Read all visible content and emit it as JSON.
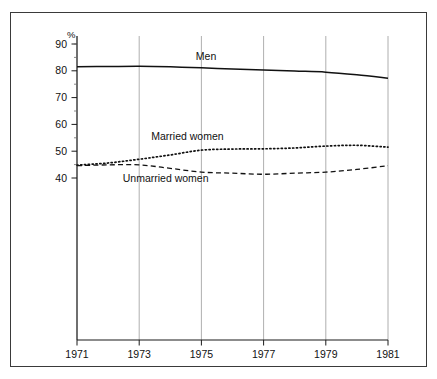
{
  "chart_data": {
    "type": "line",
    "title": "",
    "subtitle": "",
    "xlabel": "",
    "ylabel": "%",
    "yunit_label": "%",
    "xlim": [
      1971,
      1981
    ],
    "ylim": [
      35,
      92
    ],
    "y_tick_values": [
      40,
      50,
      60,
      70,
      80,
      90
    ],
    "y_tick_labels": [
      "40",
      "50",
      "60",
      "70",
      "80",
      "90"
    ],
    "y_minor_tick_values": [
      45,
      55,
      65,
      75,
      85,
      90
    ],
    "x_tick_values": [
      1971,
      1973,
      1975,
      1977,
      1979,
      1981
    ],
    "x_tick_labels": [
      "1971",
      "1973",
      "1975",
      "1977",
      "1979",
      "1981"
    ],
    "grid": "vertical-only",
    "legend": "inline-labels",
    "x": [
      1971,
      1972,
      1973,
      1974,
      1975,
      1976,
      1977,
      1978,
      1979,
      1980,
      1981
    ],
    "series": [
      {
        "name": "Men",
        "label": "Men",
        "style": "solid",
        "color": "#111111",
        "label_x": 1975.15,
        "label_y": 84.2,
        "values": [
          81.5,
          81.6,
          81.7,
          81.5,
          81.1,
          80.7,
          80.3,
          79.9,
          79.5,
          78.5,
          77.2
        ]
      },
      {
        "name": "Married women",
        "label": "Married women",
        "style": "dotted",
        "color": "#111111",
        "label_x": 1974.55,
        "label_y": 54.3,
        "values": [
          44.8,
          45.6,
          47.0,
          48.6,
          50.4,
          50.8,
          50.9,
          51.2,
          51.9,
          52.2,
          51.5
        ]
      },
      {
        "name": "Unmarried women",
        "label": "Unmarried women",
        "style": "dashed",
        "color": "#111111",
        "label_x": 1973.85,
        "label_y": 38.6,
        "values": [
          44.6,
          44.9,
          44.9,
          43.6,
          42.2,
          41.8,
          41.4,
          41.8,
          42.2,
          43.2,
          44.6
        ]
      }
    ]
  }
}
